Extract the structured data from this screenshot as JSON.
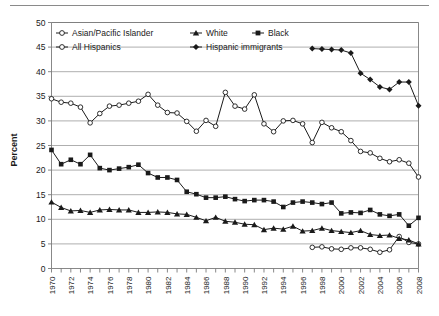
{
  "chart_data": {
    "type": "line",
    "title": "",
    "xlabel": "",
    "ylabel": "Percent",
    "ylim": [
      0,
      50
    ],
    "ytick_step": 5,
    "yticks": [
      "0",
      "5",
      "10",
      "15",
      "20",
      "25",
      "30",
      "35",
      "40",
      "45",
      "50"
    ],
    "xlim": [
      1970,
      2008
    ],
    "xtick_step": 1,
    "xlabel_step": 2,
    "xticks": [
      "1970",
      "1972",
      "1974",
      "1976",
      "1978",
      "1980",
      "1982",
      "1984",
      "1986",
      "1988",
      "1990",
      "1992",
      "1994",
      "1996",
      "1998",
      "2000",
      "2002",
      "2004",
      "2006",
      "2008"
    ],
    "grid": "horizontal",
    "legend_position": "top-inside",
    "series": [
      {
        "name": "Asian/Pacific Islander",
        "marker": "open-circle",
        "color": "#1a1a1a",
        "x": [
          1997,
          1998,
          1999,
          2000,
          2001,
          2002,
          2003,
          2004,
          2005,
          2006,
          2007,
          2008
        ],
        "values": [
          4.3,
          4.4,
          4.0,
          3.9,
          4.2,
          4.2,
          3.9,
          3.3,
          3.8,
          6.5,
          5.3,
          5.0
        ]
      },
      {
        "name": "All Hispanics",
        "marker": "open-circle",
        "color": "#1a1a1a",
        "x": [
          1970,
          1971,
          1972,
          1973,
          1974,
          1975,
          1976,
          1977,
          1978,
          1979,
          1980,
          1981,
          1982,
          1983,
          1984,
          1985,
          1986,
          1987,
          1988,
          1989,
          1990,
          1991,
          1992,
          1993,
          1994,
          1995,
          1996,
          1997,
          1998,
          1999,
          2000,
          2001,
          2002,
          2003,
          2004,
          2005,
          2006,
          2007,
          2008
        ],
        "values": [
          34.5,
          33.8,
          33.6,
          32.8,
          29.6,
          31.5,
          33.0,
          33.2,
          33.6,
          34.0,
          35.4,
          33.2,
          31.7,
          31.6,
          29.9,
          27.9,
          30.1,
          28.9,
          35.8,
          33.0,
          32.4,
          35.3,
          29.4,
          27.8,
          30.0,
          30.1,
          29.4,
          25.6,
          29.7,
          28.6,
          27.8,
          26.0,
          23.8,
          23.5,
          22.4,
          21.7,
          22.1,
          21.4,
          18.6
        ]
      },
      {
        "name": "White",
        "marker": "filled-triangle",
        "color": "#1a1a1a",
        "x": [
          1970,
          1971,
          1972,
          1973,
          1974,
          1975,
          1976,
          1977,
          1978,
          1979,
          1980,
          1981,
          1982,
          1983,
          1984,
          1985,
          1986,
          1987,
          1988,
          1989,
          1990,
          1991,
          1992,
          1993,
          1994,
          1995,
          1996,
          1997,
          1998,
          1999,
          2000,
          2001,
          2002,
          2003,
          2004,
          2005,
          2006,
          2007,
          2008
        ],
        "values": [
          13.5,
          12.4,
          11.7,
          11.8,
          11.4,
          11.9,
          12.0,
          11.9,
          11.9,
          11.4,
          11.4,
          11.5,
          11.4,
          11.1,
          11.0,
          10.4,
          9.7,
          10.4,
          9.6,
          9.4,
          9.0,
          8.9,
          7.9,
          8.2,
          8.0,
          8.6,
          7.6,
          7.7,
          8.2,
          7.7,
          7.5,
          7.3,
          7.7,
          6.9,
          6.7,
          6.8,
          6.1,
          5.8,
          5.0
        ]
      },
      {
        "name": "Black",
        "marker": "filled-square",
        "color": "#1a1a1a",
        "x": [
          1970,
          1971,
          1972,
          1973,
          1974,
          1975,
          1976,
          1977,
          1978,
          1979,
          1980,
          1981,
          1982,
          1983,
          1984,
          1985,
          1986,
          1987,
          1988,
          1989,
          1990,
          1991,
          1992,
          1993,
          1994,
          1995,
          1996,
          1997,
          1998,
          1999,
          2000,
          2001,
          2002,
          2003,
          2004,
          2005,
          2006,
          2007,
          2008
        ],
        "values": [
          24.1,
          21.2,
          22.1,
          21.2,
          23.1,
          20.4,
          20.0,
          20.3,
          20.6,
          21.1,
          19.4,
          18.5,
          18.5,
          18.0,
          15.6,
          15.1,
          14.4,
          14.4,
          14.6,
          14.1,
          13.7,
          13.9,
          13.9,
          13.6,
          12.5,
          13.4,
          13.6,
          13.4,
          13.1,
          13.4,
          11.2,
          11.4,
          11.3,
          11.9,
          11.0,
          10.7,
          11.0,
          8.7,
          10.3
        ]
      },
      {
        "name": "Hispanic immigrants",
        "marker": "filled-diamond",
        "color": "#1a1a1a",
        "x": [
          1997,
          1998,
          1999,
          2000,
          2001,
          2002,
          2003,
          2004,
          2005,
          2006,
          2007,
          2008
        ],
        "values": [
          44.7,
          44.6,
          44.5,
          44.4,
          43.8,
          39.7,
          38.4,
          36.9,
          36.4,
          37.9,
          37.9,
          33.1
        ]
      }
    ]
  },
  "legend": {
    "entries": [
      {
        "label": "Asian/Pacific Islander",
        "marker": "open-circle"
      },
      {
        "label": "White",
        "marker": "filled-triangle"
      },
      {
        "label": "Black",
        "marker": "filled-square"
      },
      {
        "label": "All Hispanics",
        "marker": "open-circle"
      },
      {
        "label": "Hispanic immigrants",
        "marker": "filled-diamond"
      }
    ]
  },
  "axis": {
    "y_title": "Percent"
  },
  "colors": {
    "line": "#1a1a1a",
    "grid": "#9a9a9a",
    "frame": "#7a7a7a",
    "rule": "#8a8a8a"
  }
}
